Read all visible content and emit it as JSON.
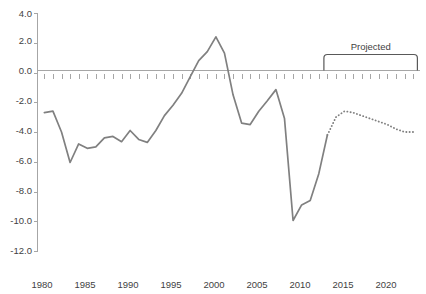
{
  "chart_data": {
    "type": "line",
    "title": "",
    "xlabel": "",
    "ylabel": "",
    "xlim": [
      1979.2,
      2023.8
    ],
    "ylim": [
      -12.0,
      4.0
    ],
    "grid": false,
    "legend": "none",
    "y_ticks": [
      "4.0",
      "2.0",
      "0.0",
      "-2.0",
      "-4.0",
      "-6.0",
      "-8.0",
      "-10.0",
      "-12.0"
    ],
    "y_tick_values": [
      4.0,
      2.0,
      0.0,
      -2.0,
      -4.0,
      -6.0,
      -8.0,
      -10.0,
      -12.0
    ],
    "x_ticks": [
      "1980",
      "1985",
      "1990",
      "1995",
      "2000",
      "2005",
      "2010",
      "2015",
      "2020"
    ],
    "x_tick_values": [
      1980,
      1985,
      1990,
      1995,
      2000,
      2005,
      2010,
      2015,
      2020
    ],
    "x_minor_step": 1,
    "annotations": [
      {
        "name": "projected-bracket-label",
        "text": "Projected",
        "x_start": 2012.6,
        "x_end": 2023.5,
        "y": 0.0
      }
    ],
    "series": [
      {
        "name": "Actual",
        "style": "solid",
        "color": "#808080",
        "x": [
          1980,
          1981,
          1982,
          1983,
          1984,
          1985,
          1986,
          1987,
          1988,
          1989,
          1990,
          1991,
          1992,
          1993,
          1994,
          1995,
          1996,
          1997,
          1998,
          1999,
          2000,
          2001,
          2002,
          2003,
          2004,
          2005,
          2006,
          2007,
          2008,
          2009,
          2010,
          2011,
          2012,
          2013
        ],
        "values": [
          -2.7,
          -2.6,
          -4.0,
          -6.05,
          -4.8,
          -5.1,
          -5.0,
          -4.4,
          -4.3,
          -4.65,
          -3.9,
          -4.5,
          -4.7,
          -3.9,
          -2.9,
          -2.2,
          -1.4,
          -0.3,
          0.8,
          1.4,
          2.4,
          1.3,
          -1.5,
          -3.4,
          -3.5,
          -2.6,
          -1.9,
          -1.15,
          -3.1,
          -9.95,
          -8.9,
          -8.6,
          -6.8,
          -4.2
        ]
      },
      {
        "name": "Projected",
        "style": "dotted",
        "color": "#808080",
        "x": [
          2013,
          2014,
          2015,
          2016,
          2017,
          2018,
          2019,
          2020,
          2021,
          2022,
          2023
        ],
        "values": [
          -4.2,
          -3.0,
          -2.6,
          -2.7,
          -2.9,
          -3.1,
          -3.3,
          -3.5,
          -3.8,
          -4.0,
          -4.0
        ]
      }
    ]
  }
}
